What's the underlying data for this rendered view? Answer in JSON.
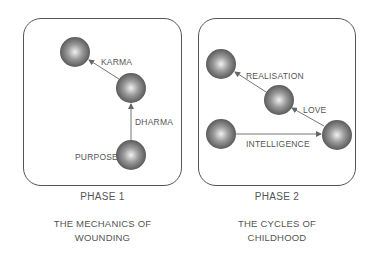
{
  "panels": [
    {
      "caption": "PHASE 1",
      "subtitle_line1": "THE MECHANICS OF",
      "subtitle_line2": "WOUNDING",
      "labels": {
        "karma": "KARMA",
        "dharma": "DHARMA",
        "purpose": "PURPOSE"
      }
    },
    {
      "caption": "PHASE 2",
      "subtitle_line1": "THE CYCLES OF",
      "subtitle_line2": "CHILDHOOD",
      "labels": {
        "realisation": "REALISATION",
        "love": "LOVE",
        "intelligence": "INTELLIGENCE"
      }
    }
  ],
  "colors": {
    "border": "#555555",
    "sphere_dark": "#5a5a5a",
    "sphere_light": "#e8e8e8",
    "text": "#555555"
  }
}
